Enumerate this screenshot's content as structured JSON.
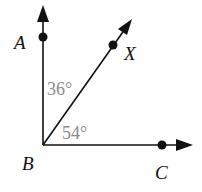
{
  "diagram": {
    "type": "angle-diagram",
    "vertex": {
      "name": "B",
      "x": 43,
      "y": 145
    },
    "rays": [
      {
        "id": "BA",
        "point": "A",
        "dot": {
          "x": 43,
          "y": 37
        },
        "tip": {
          "x": 43,
          "y": 5
        }
      },
      {
        "id": "BX",
        "point": "X",
        "dot": {
          "x": 113,
          "y": 45
        },
        "tip": {
          "x": 132,
          "y": 19
        }
      },
      {
        "id": "BC",
        "point": "C",
        "dot": {
          "x": 162,
          "y": 145
        },
        "tip": {
          "x": 193,
          "y": 145
        }
      }
    ],
    "labels": {
      "A": "A",
      "X": "X",
      "B": "B",
      "C": "C"
    },
    "angles": [
      {
        "name": "angle-ABX",
        "value": "36°"
      },
      {
        "name": "angle-XBC",
        "value": "54°"
      }
    ],
    "colors": {
      "line": "#111111",
      "angle_text": "#8a8a8a",
      "point_text": "#111111"
    }
  }
}
